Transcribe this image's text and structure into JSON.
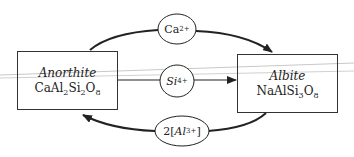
{
  "diagram": {
    "type": "substitution-flow",
    "colors": {
      "stroke": "#222222",
      "box_border": "#333333",
      "artifact_line": "#c8c8c8",
      "background": "#ffffff"
    },
    "nodes": {
      "anorthite": {
        "name": "Anorthite",
        "formula_parts": [
          "CaAl",
          "2",
          "Si",
          "2",
          "O",
          "8"
        ]
      },
      "albite": {
        "name": "Albite",
        "formula_parts": [
          "NaAlSi",
          "3",
          "O",
          "8"
        ]
      }
    },
    "edges": [
      {
        "id": "ca",
        "from": "Anorthite",
        "to": "Albite",
        "label_base": "Ca",
        "label_charge": "2+",
        "label_prefix": "",
        "label_suffix": ""
      },
      {
        "id": "si",
        "from": "Anorthite",
        "to": "Albite",
        "label_base": "Si",
        "label_charge": "4+",
        "label_prefix": "",
        "label_suffix": ""
      },
      {
        "id": "al",
        "from": "Albite",
        "to": "Anorthite",
        "label_base": "Al",
        "label_charge": "3+",
        "label_prefix": "2[",
        "label_suffix": "]"
      }
    ]
  }
}
